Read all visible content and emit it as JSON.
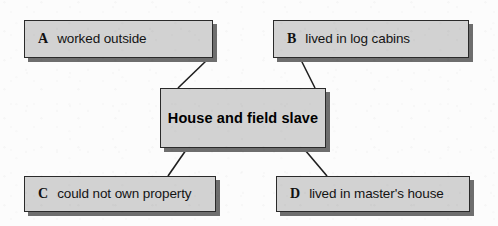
{
  "diagram": {
    "type": "concept-map",
    "center": {
      "id": "center",
      "label": "House and field slave"
    },
    "options": [
      {
        "id": "a",
        "key": "A",
        "label": "worked outside"
      },
      {
        "id": "b",
        "key": "B",
        "label": "lived in log cabins"
      },
      {
        "id": "c",
        "key": "C",
        "label": "could not own property"
      },
      {
        "id": "d",
        "key": "D",
        "label": "lived in master's house"
      }
    ],
    "colors": {
      "box_fill": "#d2d2d2",
      "box_border": "#2a2a2a",
      "box_shadow": "#6e6e6e",
      "background": "#fcfcfc",
      "connector": "#1f1f1f",
      "text": "#141414"
    },
    "connectors": [
      {
        "from": "a",
        "to": "center"
      },
      {
        "from": "b",
        "to": "center"
      },
      {
        "from": "center",
        "to": "c"
      },
      {
        "from": "center",
        "to": "d"
      }
    ]
  }
}
